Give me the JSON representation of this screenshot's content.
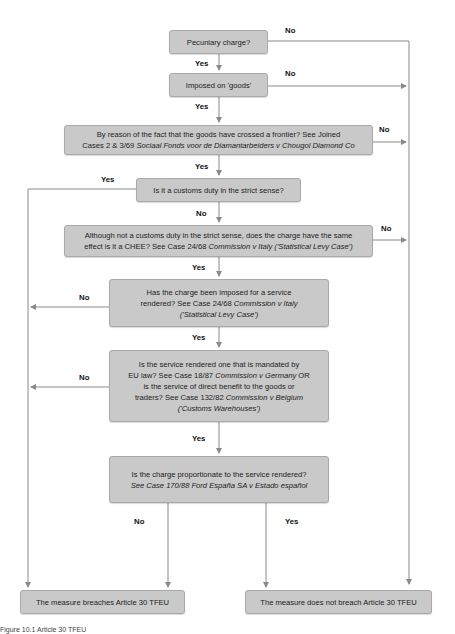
{
  "diagram": {
    "type": "flowchart",
    "colors": {
      "node_fill": "#c9c9c9",
      "node_border": "#a9a9a9",
      "line": "#8a8a8a",
      "background": "#ffffff"
    },
    "nodes": [
      {
        "id": "q1",
        "text": "Pecuniary charge?"
      },
      {
        "id": "q2",
        "text": "Imposed on 'goods'"
      },
      {
        "id": "q3",
        "line1": "By reason of the fact that the goods have crossed a frontier? See Joined",
        "line2_plain": "Cases 2 & 3/69 ",
        "line2_italic": "Sociaal Fonds voor de Diamantarbeiders v Chougol Diamond Co"
      },
      {
        "id": "q4",
        "text": "Is it a customs duty in the strict sense?"
      },
      {
        "id": "q5",
        "line1": "Although not a customs duty in the strict sense, does the charge have the same",
        "line2_plain": "effect is it a CHEE? See Case 24/68 ",
        "line2_italic": "Commission v Italy ('Statistical Levy Case')"
      },
      {
        "id": "q6",
        "line1": "Has the charge been imposed for a service",
        "line2_plain": "rendered? See Case 24/68 ",
        "line2_italic": "Commission v Italy",
        "line3_italic": "('Statistical Levy Case')"
      },
      {
        "id": "q7",
        "line1": "Is the service rendered one that is mandated by",
        "line2_plain": "EU law? See Case 18/87 ",
        "line2_italic": "Commission v Germany",
        "line2_tail": " OR",
        "line3": "is the service of direct benefit to the goods or",
        "line4_plain": "traders?  See Case 132/82 ",
        "line4_italic": "Commission v Belgium",
        "line5_italic": "('Customs Warehouses')"
      },
      {
        "id": "q8",
        "line1": "Is the charge proportionate to the service rendered?",
        "line2_italic": "See Case 170/88 Ford España SA v Estado español"
      },
      {
        "id": "out_breach",
        "text": "The measure breaches Article 30 TFEU"
      },
      {
        "id": "out_no_breach",
        "text": "The measure does not breach Article 30 TFEU"
      }
    ],
    "edge_labels": {
      "q1_no": "No",
      "q1_yes": "Yes",
      "q2_no": "No",
      "q2_yes": "Yes",
      "q3_no": "No",
      "q3_yes": "Yes",
      "q4_yes": "Yes",
      "q4_no": "No",
      "q5_no": "No",
      "q5_yes": "Yes",
      "q6_no": "No",
      "q6_yes": "Yes",
      "q7_no": "No",
      "q7_yes": "Yes",
      "q8_no": "No",
      "q8_yes": "Yes"
    },
    "edges": [
      {
        "from": "q1",
        "to": "q2",
        "label": "Yes"
      },
      {
        "from": "q1",
        "to": "out_no_breach",
        "label": "No"
      },
      {
        "from": "q2",
        "to": "q3",
        "label": "Yes"
      },
      {
        "from": "q2",
        "to": "out_no_breach",
        "label": "No"
      },
      {
        "from": "q3",
        "to": "q4",
        "label": "Yes"
      },
      {
        "from": "q3",
        "to": "out_no_breach",
        "label": "No"
      },
      {
        "from": "q4",
        "to": "out_breach",
        "label": "Yes"
      },
      {
        "from": "q4",
        "to": "q5",
        "label": "No"
      },
      {
        "from": "q5",
        "to": "q6",
        "label": "Yes"
      },
      {
        "from": "q5",
        "to": "out_no_breach",
        "label": "No"
      },
      {
        "from": "q6",
        "to": "out_breach",
        "label": "No"
      },
      {
        "from": "q6",
        "to": "q7",
        "label": "Yes"
      },
      {
        "from": "q7",
        "to": "out_breach",
        "label": "No"
      },
      {
        "from": "q7",
        "to": "q8",
        "label": "Yes"
      },
      {
        "from": "q8",
        "to": "out_breach",
        "label": "No"
      },
      {
        "from": "q8",
        "to": "out_no_breach",
        "label": "Yes"
      }
    ]
  },
  "caption": "Figure 10.1 Article 30 TFEU"
}
